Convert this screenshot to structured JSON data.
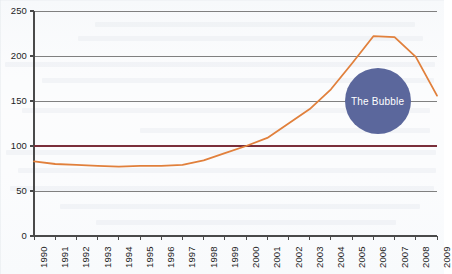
{
  "chart_data": {
    "type": "line",
    "title": "",
    "subtitle": "",
    "xlabel": "",
    "ylabel": "",
    "xlim": [
      1990,
      2009
    ],
    "ylim": [
      0,
      250
    ],
    "grid": true,
    "legend_position": "none",
    "categories": [
      "1990",
      "1991",
      "1992",
      "1993",
      "1994",
      "1995",
      "1996",
      "1997",
      "1998",
      "1999",
      "2000",
      "2001",
      "2002",
      "2003",
      "2004",
      "2005",
      "2006",
      "2007",
      "2008",
      "2009"
    ],
    "x_tick_labels": [
      "1990",
      "1991",
      "1992",
      "1993",
      "1994",
      "1995",
      "1996",
      "1997",
      "1998",
      "1999",
      "2000",
      "2001",
      "2002",
      "2003",
      "2004",
      "2005",
      "2006",
      "2007",
      "2008",
      "2009"
    ],
    "y_tick_labels": [
      "0",
      "50",
      "100",
      "150",
      "200",
      "250"
    ],
    "y_ticks": [
      0,
      50,
      100,
      150,
      200,
      250
    ],
    "series": [
      {
        "name": "index",
        "color": "#e1803c",
        "values": [
          83,
          80,
          79,
          78,
          77,
          78,
          78,
          79,
          84,
          92,
          100,
          109,
          125,
          141,
          163,
          192,
          222,
          221,
          199,
          156
        ]
      }
    ],
    "reference_lines": [
      {
        "name": "baseline-100",
        "value": 100,
        "color": "#7a2f3a",
        "orientation": "horizontal"
      }
    ],
    "annotations": [
      {
        "name": "the-bubble",
        "label": "The Bubble",
        "shape": "circle",
        "color": "#5b679c",
        "text_color": "#ffffff",
        "center_x": 2006.2,
        "center_y": 150,
        "radius_px": 33
      }
    ],
    "colors": {
      "line": "#e1803c",
      "reference_line": "#7a2f3a",
      "gridline": "#808080",
      "axis": "#4a4a4a",
      "bubble": "#5b679c",
      "background": "#fbfcfd",
      "tick_text": "#1d1d1d"
    }
  }
}
